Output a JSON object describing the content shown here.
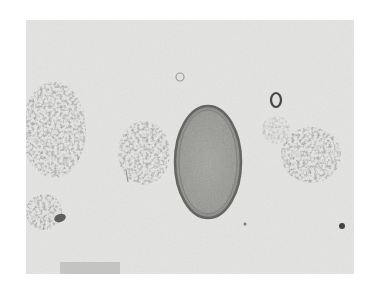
{
  "image": {
    "description": "Brightfield micrograph of a barrel-shaped helminth egg with bipolar plugs, surrounded by debris clumps",
    "colors": {
      "page_background": "#ffffff",
      "field_background": "#e4e4e2",
      "egg_shell": "#6b6b68",
      "egg_interior": "#9a9a96",
      "debris": "#7a7a78"
    }
  }
}
